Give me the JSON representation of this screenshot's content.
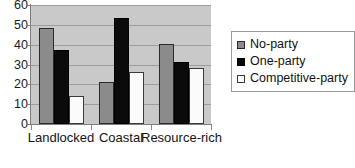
{
  "chart_data": {
    "type": "bar",
    "title": "",
    "subtitle": "",
    "xlabel": "",
    "ylabel": "",
    "categories": [
      "Landlocked",
      "Coastal",
      "Resource-rich"
    ],
    "series": [
      {
        "name": "No-party",
        "values": [
          48.5,
          21.0,
          40.5
        ],
        "color": "#8b8b8b"
      },
      {
        "name": "One-party",
        "values": [
          37.5,
          53.5,
          31.5
        ],
        "color": "#0b0b0b"
      },
      {
        "name": "Competitive-party",
        "values": [
          14.0,
          26.0,
          28.0
        ],
        "color": "#ffffff"
      }
    ],
    "ylim": [
      0,
      60
    ],
    "yticks": [
      0,
      10,
      20,
      30,
      40,
      50,
      60
    ],
    "ytick_labels": [
      "0",
      "10",
      "20",
      "30",
      "40",
      "50",
      "60"
    ],
    "grid": true,
    "grid_axis": "y",
    "legend": {
      "position": "right",
      "entries": [
        "No-party",
        "One-party",
        "Competitive-party"
      ]
    },
    "plot_background": "#c9c9c9",
    "gridline_color": "#9d9d9d",
    "axis_color": "#7e7e7e"
  }
}
